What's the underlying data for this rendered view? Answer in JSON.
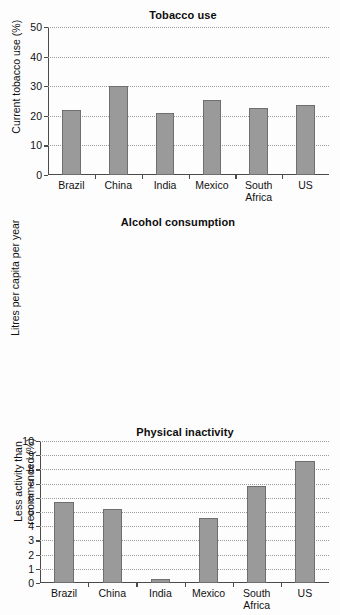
{
  "chart_data": [
    {
      "type": "bar",
      "title": "Tobacco use",
      "xlabel": "",
      "ylabel": "Current tobacco use (%)",
      "categories": [
        "Brazil",
        "China",
        "India",
        "Mexico",
        "South\nAfrica",
        "US"
      ],
      "values": [
        22,
        30,
        21,
        25.5,
        22.7,
        23.5
      ],
      "ylim": [
        0,
        50
      ],
      "yticks": [
        0,
        10,
        20,
        30,
        40,
        50
      ],
      "grid": true,
      "legend": "none",
      "bar_color": "#9a9a9a",
      "bar_edge_color": "#6f6f6f"
    },
    {
      "type": "bar",
      "title": "Alcohol consumption",
      "xlabel": "",
      "ylabel": "Litres per capita per year",
      "categories": [
        "Brazil",
        "China",
        "India",
        "Mexico",
        "South\nAfrica",
        "US"
      ],
      "values": [
        5.7,
        5.2,
        0.3,
        4.6,
        6.8,
        8.6
      ],
      "ylim": [
        0,
        10
      ],
      "yticks": [
        0,
        1,
        2,
        3,
        4,
        5,
        6,
        7,
        8,
        9,
        10
      ],
      "grid": true,
      "legend": "none",
      "bar_color": "#9a9a9a",
      "bar_edge_color": "#6f6f6f"
    },
    {
      "type": "bar",
      "title": "Physical inactivity",
      "xlabel": "",
      "ylabel": "Less activity than\nrecommended (%)",
      "categories": [
        "Brazil",
        "China",
        "India",
        "Mexico",
        "South\nAfrica",
        "US"
      ],
      "values": [
        27.5,
        11,
        12,
        17,
        45,
        25
      ],
      "ylim": [
        0,
        50
      ],
      "yticks": [
        0,
        10,
        20,
        30,
        40,
        50
      ],
      "grid": true,
      "legend": "none",
      "bar_color": "#9a9a9a",
      "bar_edge_color": "#6f6f6f"
    }
  ],
  "figure": {
    "background": "#fdfdfd",
    "axis_color": "#4a4a4a",
    "gridline_color": "#9c9c9c"
  }
}
